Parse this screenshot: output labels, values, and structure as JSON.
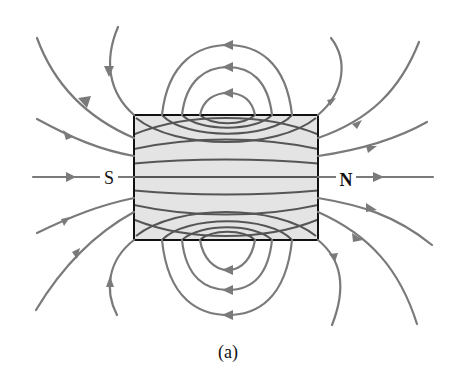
{
  "figure": {
    "caption": "(a)",
    "poles": {
      "left": "S",
      "right": "N"
    },
    "colors": {
      "field_line": "#7a7a7a",
      "magnet_fill": "#e4e4e4",
      "magnet_outline": "#111111",
      "text": "#111111"
    },
    "magnet": {
      "x": 134,
      "y": 115,
      "width": 184,
      "height": 125
    }
  }
}
